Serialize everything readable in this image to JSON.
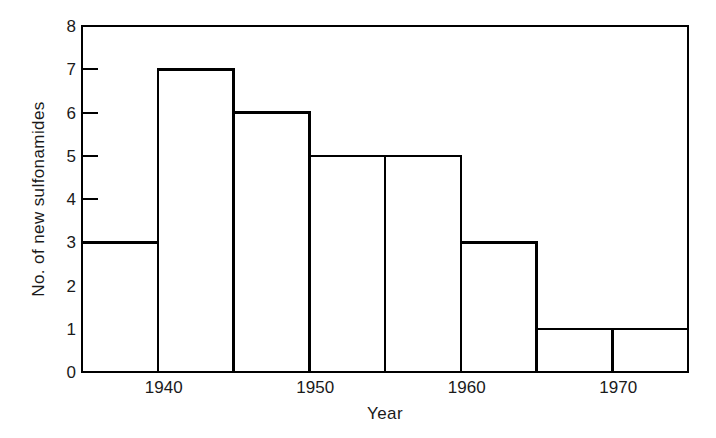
{
  "chart_data": {
    "type": "bar",
    "title": "",
    "subtitle": "",
    "xlabel": "Year",
    "ylabel": "No. of new sulfonamides",
    "categories": [
      "1935-1940",
      "1940-1945",
      "1945-1950",
      "1950-1955",
      "1955-1960",
      "1960-1965",
      "1965-1970",
      "1970-1975"
    ],
    "bin_edges": [
      1935,
      1940,
      1945,
      1950,
      1955,
      1960,
      1965,
      1970,
      1975
    ],
    "values": [
      3,
      7,
      6,
      5,
      5,
      3,
      1,
      1
    ],
    "bin_width": 5,
    "xlim": [
      1935,
      1975
    ],
    "ylim": [
      0,
      8
    ],
    "x_tick_values": [
      1940,
      1950,
      1960,
      1970
    ],
    "x_tick_labels": [
      "1940",
      "1950",
      "1960",
      "1970"
    ],
    "y_tick_values": [
      0,
      1,
      2,
      3,
      4,
      5,
      6,
      7,
      8
    ],
    "y_tick_labels": [
      "0",
      "1",
      "2",
      "3",
      "4",
      "5",
      "6",
      "7",
      "8"
    ],
    "grid": false,
    "legend": null,
    "legend_position": "none",
    "annotations": [],
    "style": {
      "line_color": "#000000",
      "bar_fill": "#ffffff",
      "background": "#ffffff",
      "axis_color": "#000000",
      "text_color": "#1a1a1a"
    }
  }
}
